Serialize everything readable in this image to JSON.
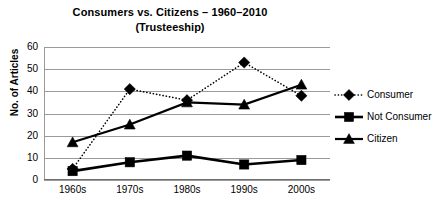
{
  "chart_data": {
    "type": "line",
    "title": "Consumers vs. Citizens – 1960–2010",
    "subtitle": "(Trusteeship)",
    "xlabel": "",
    "ylabel": "No. of Articles",
    "categories": [
      "1960s",
      "1970s",
      "1980s",
      "1990s",
      "2000s"
    ],
    "ylim": [
      0,
      60
    ],
    "ytick_step": 10,
    "yticks": [
      "0",
      "10",
      "20",
      "30",
      "40",
      "50",
      "60"
    ],
    "grid": "horizontal",
    "legend_position": "right",
    "series": [
      {
        "name": "Consumer",
        "values": [
          5,
          41,
          36,
          53,
          38
        ],
        "marker": "diamond",
        "line_style": "dotted",
        "color": "#000000"
      },
      {
        "name": "Not Consumer",
        "values": [
          4,
          8,
          11,
          7,
          9
        ],
        "marker": "square",
        "line_style": "solid-thick",
        "color": "#000000"
      },
      {
        "name": "Citizen",
        "values": [
          17,
          25,
          35,
          34,
          43
        ],
        "marker": "triangle",
        "line_style": "solid",
        "color": "#000000"
      }
    ]
  }
}
